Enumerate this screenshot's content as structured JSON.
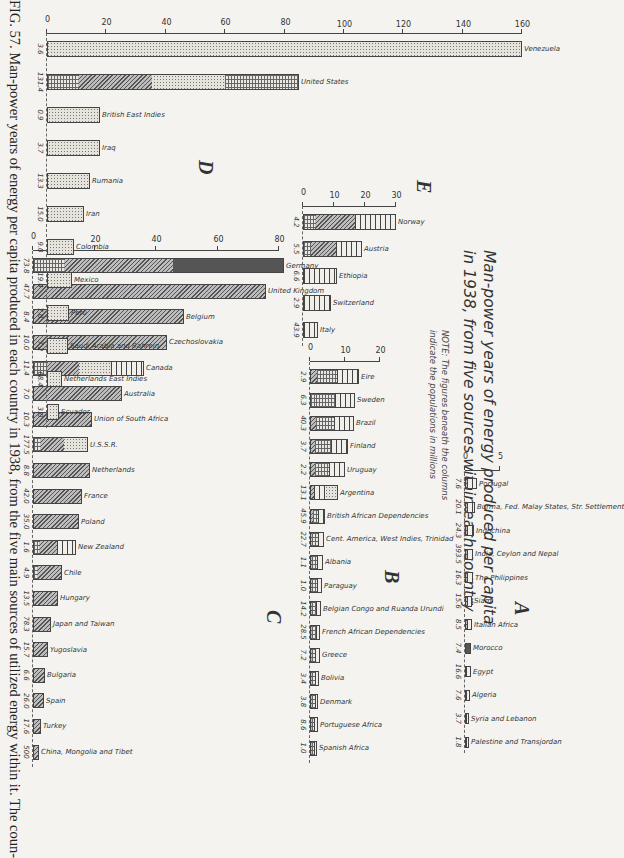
{
  "title": {
    "line1": "Man-power years of energy produced per capita",
    "line2": "in 1938, from five sources within each country"
  },
  "note": {
    "line1": "NOTE: The figures beneath the columns",
    "line2": "indicate the populations in millions"
  },
  "caption": "FIG. 57. Man-power years of energy per capita produced in each country in 1938, from the five main sources of utilized energy within it. The coun-",
  "legend_patterns": {
    "stipple": "oil / petroleum",
    "diagonal": "coal",
    "horizontal": "water power",
    "grid": "wood / fuel",
    "solid": "lignite"
  },
  "chart_data": [
    {
      "type": "bar",
      "group": "A",
      "title": "Man-power years of energy produced per capita in 1938, from five sources within each country",
      "ylabel": "Man-power years per capita",
      "ylim": [
        0,
        5
      ],
      "yticks": [
        0,
        5
      ],
      "categories": [
        "Palestine and Transjordan",
        "Syria and Lebanon",
        "Algeria",
        "Egypt",
        "Morocco",
        "Italian Africa",
        "Siam",
        "The Philippines",
        "India, Ceylon and Nepal",
        "Indochina",
        "Burma, Fed. Malay States, Str. Settlement",
        "Portugal"
      ],
      "values": [
        0.5,
        0.6,
        0.7,
        0.8,
        0.9,
        1.0,
        1.0,
        1.1,
        1.2,
        1.3,
        1.4,
        1.7
      ],
      "populations": [
        "1.8",
        "3.7",
        "7.6",
        "16.6",
        "7.4",
        "8.5",
        "15.6",
        "16.3",
        "393.5",
        "24.3",
        "20.1",
        "7.6"
      ]
    },
    {
      "type": "bar",
      "group": "B",
      "ylim": [
        0,
        20
      ],
      "yticks": [
        0,
        10,
        20
      ],
      "categories": [
        "Spanish Africa",
        "Portuguese Africa",
        "Denmark",
        "Bolivia",
        "Greece",
        "French African Dependencies",
        "Belgian Congo and Ruanda Urundi",
        "Paraguay",
        "Albania",
        "Cent. America, West Indies, Trinidad",
        "British African Dependencies",
        "Argentina",
        "Uruguay",
        "Finland",
        "Brazil",
        "Sweden",
        "Eire"
      ],
      "values": [
        2.0,
        2.2,
        2.4,
        2.6,
        2.8,
        3.0,
        3.2,
        3.4,
        3.6,
        3.9,
        4.3,
        8.0,
        10.0,
        11.0,
        12.5,
        13.0,
        14.0
      ],
      "populations": [
        "1.0",
        "8.6",
        "3.8",
        "3.4",
        "7.2",
        "28.5",
        "14.2",
        "1.0",
        "1.1",
        "22.7",
        "45.9",
        "13.1",
        "2.2",
        "3.7",
        "40.3",
        "6.3",
        "2.9"
      ]
    },
    {
      "type": "bar",
      "group": "C",
      "ylim": [
        0,
        80
      ],
      "yticks": [
        0,
        20,
        40,
        60,
        80
      ],
      "categories": [
        "China, Mongolia and Tibet",
        "Turkey",
        "Spain",
        "Bulgaria",
        "Yugoslavia",
        "Japan and Taiwan",
        "Hungary",
        "Chile",
        "New Zealand",
        "Poland",
        "France",
        "Netherlands",
        "U.S.S.R.",
        "Union of South Africa",
        "Australia",
        "Canada",
        "Czechoslovakia",
        "Belgium",
        "United Kingdom",
        "Germany"
      ],
      "values": [
        2.0,
        2.5,
        3.5,
        4.0,
        5.0,
        6.0,
        8.0,
        9.5,
        14.0,
        15.0,
        16.0,
        18.5,
        18.0,
        19.0,
        29.0,
        36.0,
        43.5,
        49.0,
        75.5,
        81.5
      ],
      "populations": [
        "500",
        "17.6",
        "26.0",
        "6.6",
        "15.7",
        "78.3",
        "13.5",
        "4.9",
        "1.6",
        "35.0",
        "42.0",
        "8.8",
        "177.5",
        "10.3",
        "7.0",
        "11.4",
        "10.0",
        "8.4",
        "47.7",
        "73.8"
      ]
    },
    {
      "type": "bar",
      "group": "D",
      "ylim": [
        0,
        160
      ],
      "yticks": [
        0,
        20,
        40,
        60,
        80,
        100,
        120,
        140,
        160
      ],
      "categories": [
        "Ecuador",
        "Netherlands East Indies",
        "Saudi Arabia and Bahrein",
        "Peru",
        "Mexico",
        "Colombia",
        "Iran",
        "Rumania",
        "Iraq",
        "British East Indies",
        "United States",
        "Venezuela"
      ],
      "values": [
        4.0,
        5.0,
        7.0,
        7.5,
        8.5,
        9.0,
        12.5,
        14.5,
        18.0,
        18.0,
        85.0,
        160.0
      ],
      "populations": [
        "3.0",
        "68.4",
        "7.2",
        "7.0",
        "19.4",
        "9.0",
        "15.0",
        "13.3",
        "3.7",
        "0.9",
        "131.4",
        "3.6"
      ]
    },
    {
      "type": "bar",
      "group": "E",
      "ylim": [
        0,
        30
      ],
      "yticks": [
        0,
        10,
        20,
        30
      ],
      "categories": [
        "Italy",
        "Switzerland",
        "Ethiopia",
        "Austria",
        "Norway"
      ],
      "values": [
        5.0,
        9.0,
        11.0,
        19.0,
        30.0
      ],
      "populations": [
        "43.9",
        "2.9",
        "6.6",
        "5.5",
        "4.2"
      ]
    }
  ]
}
